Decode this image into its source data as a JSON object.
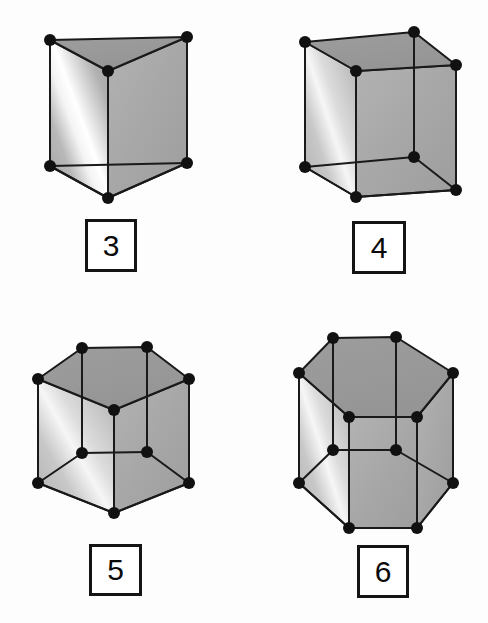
{
  "figure": {
    "background_color": "#fdfdfd",
    "vertex_color": "#111111",
    "edge_color": "#1a1a1a",
    "face_colors": {
      "top": "#9a9a9a",
      "right": "#a9a9a9",
      "left_gradient_dark": "#a0a0a0",
      "left_gradient_light": "#f2f2f2",
      "bottom": "#b4b4b4"
    },
    "vertex_radius": 6,
    "edge_width": 2
  },
  "items": [
    {
      "id": "triangular-prism",
      "label": "3",
      "sides": 3,
      "vertex_count": 6,
      "label_box": {
        "x": 85,
        "y": 219,
        "w": 52,
        "h": 53
      },
      "geometry": {
        "top": [
          [
            50,
            40
          ],
          [
            187,
            37
          ],
          [
            108,
            71
          ]
        ],
        "bottom": [
          [
            50,
            166
          ],
          [
            187,
            163
          ],
          [
            108,
            198
          ]
        ]
      }
    },
    {
      "id": "rectangular-prism",
      "label": "4",
      "sides": 4,
      "vertex_count": 8,
      "label_box": {
        "x": 352,
        "y": 221,
        "w": 54,
        "h": 53
      },
      "geometry": {
        "top": [
          [
            305,
            42
          ],
          [
            414,
            32
          ],
          [
            456,
            65
          ],
          [
            356,
            71
          ]
        ],
        "bottom": [
          [
            305,
            167
          ],
          [
            414,
            157
          ],
          [
            456,
            190
          ],
          [
            356,
            197
          ]
        ]
      }
    },
    {
      "id": "pentagonal-prism",
      "label": "5",
      "sides": 5,
      "vertex_count": 10,
      "label_box": {
        "x": 89,
        "y": 544,
        "w": 53,
        "h": 52
      },
      "geometry": {
        "top": [
          [
            82,
            348
          ],
          [
            147,
            347
          ],
          [
            189,
            379
          ],
          [
            114,
            410
          ],
          [
            38,
            379
          ]
        ],
        "bottom": [
          [
            82,
            453
          ],
          [
            147,
            452
          ],
          [
            189,
            483
          ],
          [
            114,
            513
          ],
          [
            38,
            483
          ]
        ]
      }
    },
    {
      "id": "hexagonal-prism",
      "label": "6",
      "sides": 6,
      "vertex_count": 12,
      "label_box": {
        "x": 357,
        "y": 545,
        "w": 52,
        "h": 53
      },
      "geometry": {
        "top": [
          [
            333,
            338
          ],
          [
            396,
            337
          ],
          [
            453,
            373
          ],
          [
            417,
            417
          ],
          [
            349,
            417
          ],
          [
            299,
            373
          ]
        ],
        "bottom": [
          [
            333,
            450
          ],
          [
            396,
            450
          ],
          [
            453,
            483
          ],
          [
            417,
            528
          ],
          [
            349,
            528
          ],
          [
            299,
            483
          ]
        ]
      }
    }
  ]
}
